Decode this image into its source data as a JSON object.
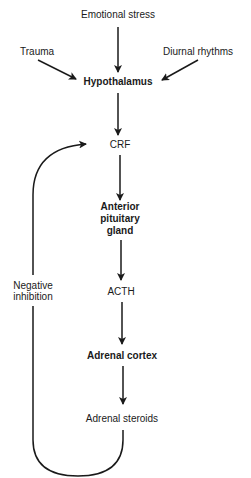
{
  "diagram": {
    "type": "flowchart",
    "nodes": {
      "emotional_stress": "Emotional stress",
      "trauma": "Trauma",
      "diurnal_rhythms": "Diurnal rhythms",
      "hypothalamus": "Hypothalamus",
      "crf": "CRF",
      "anterior_pituitary_line1": "Anterior",
      "anterior_pituitary_line2": "pituitary",
      "anterior_pituitary_line3": "gland",
      "acth": "ACTH",
      "adrenal_cortex": "Adrenal cortex",
      "adrenal_steroids": "Adrenal steroids"
    },
    "feedback": {
      "label_line1": "Negative",
      "label_line2": "inhibition"
    },
    "edges": [
      [
        "Emotional stress",
        "Hypothalamus"
      ],
      [
        "Trauma",
        "Hypothalamus"
      ],
      [
        "Diurnal rhythms",
        "Hypothalamus"
      ],
      [
        "Hypothalamus",
        "CRF"
      ],
      [
        "CRF",
        "Anterior pituitary gland"
      ],
      [
        "Anterior pituitary gland",
        "ACTH"
      ],
      [
        "ACTH",
        "Adrenal cortex"
      ],
      [
        "Adrenal cortex",
        "Adrenal steroids"
      ],
      [
        "Adrenal steroids",
        "CRF",
        "Negative inhibition"
      ]
    ],
    "colors": {
      "line": "#1a1a1a",
      "background": "#ffffff"
    }
  }
}
